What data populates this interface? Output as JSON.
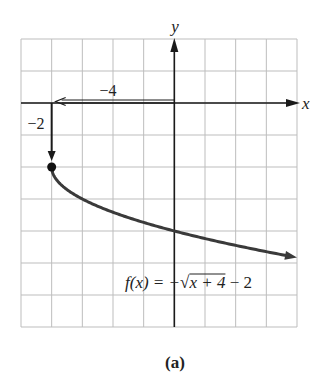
{
  "chart_data": {
    "type": "line",
    "title": "",
    "caption": "(a)",
    "xlabel": "x",
    "ylabel": "y",
    "xlim": [
      -5,
      4
    ],
    "ylim": [
      -7,
      2
    ],
    "grid": true,
    "grid_step": 1,
    "function_label": {
      "prefix": "f(x) = −",
      "radicand": "x + 4",
      "suffix": " − 2",
      "full": "f(x) = −√(x + 4) − 2"
    },
    "series": [
      {
        "name": "f(x) = −√(x + 4) − 2",
        "start_point": {
          "x": -4,
          "y": -2,
          "marker": "filled-circle"
        },
        "end_arrow": true,
        "x": [
          -4,
          -3.75,
          -3.5,
          -3,
          -2.5,
          -2,
          -1,
          0,
          1,
          2,
          3,
          4
        ],
        "y": [
          -2,
          -2.5,
          -2.71,
          -3,
          -3.22,
          -3.41,
          -3.73,
          -4,
          -4.24,
          -4.45,
          -4.65,
          -4.83
        ]
      }
    ],
    "annotations": [
      {
        "type": "arrow",
        "from": [
          0,
          0
        ],
        "to": [
          -4,
          0
        ],
        "label": "−4",
        "style": "hollow-shaft"
      },
      {
        "type": "arrow",
        "from": [
          -4,
          0
        ],
        "to": [
          -4,
          -2
        ],
        "label": "−2",
        "style": "solid"
      }
    ]
  },
  "colors": {
    "grid": "#bdbdbd",
    "axis": "#1a1a1a",
    "curve": "#3a3a3a",
    "text": "#222222",
    "background": "#ffffff"
  }
}
